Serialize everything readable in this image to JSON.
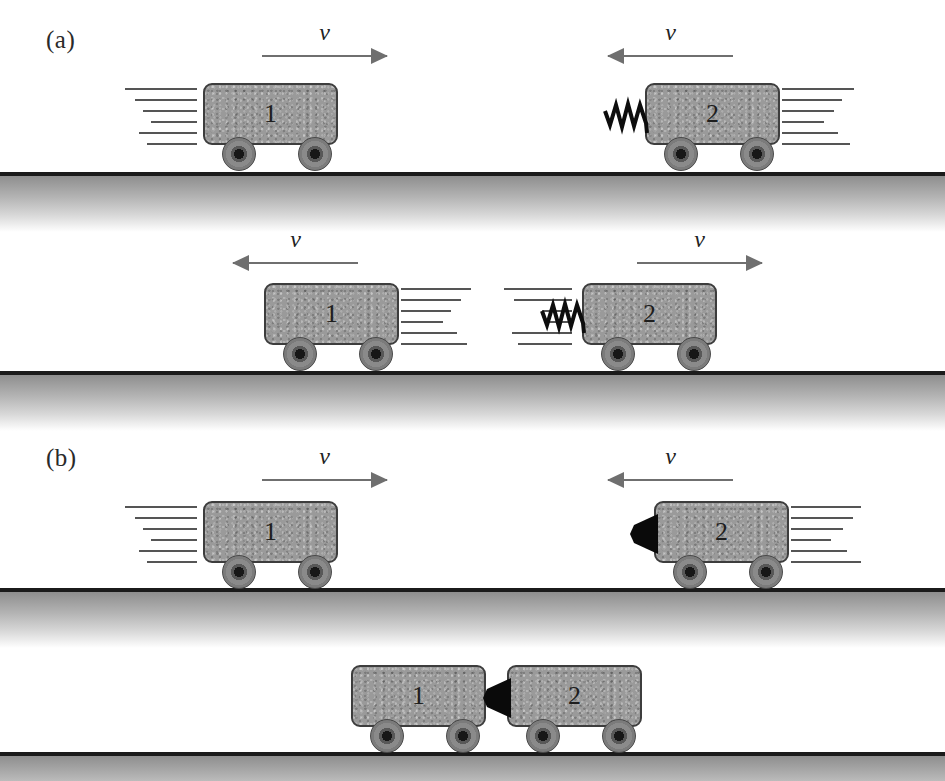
{
  "figure": {
    "panels": [
      {
        "label": "(a)",
        "x": 46,
        "y": 26
      },
      {
        "label": "(b)",
        "x": 46,
        "y": 444
      }
    ],
    "grounds": [
      {
        "y": 172
      },
      {
        "y": 371
      },
      {
        "y": 588
      },
      {
        "y": 752
      }
    ],
    "velocity_arrows": [
      {
        "name": "velocity-arrow-a1-cart1",
        "label": "v",
        "direction": "right",
        "x": 262,
        "y": 22,
        "width": 125
      },
      {
        "name": "velocity-arrow-a1-cart2",
        "label": "v",
        "direction": "left",
        "x": 608,
        "y": 22,
        "width": 125
      },
      {
        "name": "velocity-arrow-a2-cart1",
        "label": "v",
        "direction": "left",
        "x": 233,
        "y": 229,
        "width": 125
      },
      {
        "name": "velocity-arrow-a2-cart2",
        "label": "v",
        "direction": "right",
        "x": 637,
        "y": 229,
        "width": 125
      },
      {
        "name": "velocity-arrow-b1-cart1",
        "label": "v",
        "direction": "right",
        "x": 262,
        "y": 446,
        "width": 125
      },
      {
        "name": "velocity-arrow-b1-cart2",
        "label": "v",
        "direction": "left",
        "x": 608,
        "y": 446,
        "width": 125
      }
    ],
    "carts": [
      {
        "name": "cart-a1-one",
        "number": "1",
        "x": 203,
        "y": 83,
        "w": 135,
        "h": 62,
        "wheels": [
          22,
          98
        ],
        "motion": {
          "side": "left",
          "x": -78,
          "y": 5,
          "lines": [
            {
              "t": 0,
              "len": 72,
              "off": 0
            },
            {
              "t": 11,
              "len": 62,
              "off": 10
            },
            {
              "t": 22,
              "len": 54,
              "off": 18
            },
            {
              "t": 33,
              "len": 46,
              "off": 26
            },
            {
              "t": 44,
              "len": 58,
              "off": 14
            },
            {
              "t": 55,
              "len": 50,
              "off": 22
            }
          ]
        },
        "spring": null,
        "wedge": null
      },
      {
        "name": "cart-a1-two",
        "number": "2",
        "x": 645,
        "y": 83,
        "w": 135,
        "h": 62,
        "wheels": [
          22,
          98
        ],
        "motion": {
          "side": "right",
          "x": 137,
          "y": 5,
          "lines": [
            {
              "t": 0,
              "len": 72,
              "off": 0
            },
            {
              "t": 11,
              "len": 60,
              "off": 0
            },
            {
              "t": 22,
              "len": 52,
              "off": 0
            },
            {
              "t": 33,
              "len": 42,
              "off": 0
            },
            {
              "t": 44,
              "len": 56,
              "off": 0
            },
            {
              "t": 55,
              "len": 68,
              "off": 0
            }
          ]
        },
        "spring": {
          "side": "left",
          "x": -42,
          "y": 10
        },
        "wedge": null
      },
      {
        "name": "cart-a2-one",
        "number": "1",
        "x": 264,
        "y": 283,
        "w": 135,
        "h": 62,
        "wheels": [
          22,
          98
        ],
        "motion": {
          "side": "right",
          "x": 137,
          "y": 5,
          "lines": [
            {
              "t": 0,
              "len": 70,
              "off": 0
            },
            {
              "t": 11,
              "len": 60,
              "off": 0
            },
            {
              "t": 22,
              "len": 50,
              "off": 0
            },
            {
              "t": 33,
              "len": 42,
              "off": 0
            },
            {
              "t": 44,
              "len": 56,
              "off": 0
            },
            {
              "t": 55,
              "len": 66,
              "off": 0
            }
          ]
        },
        "spring": null,
        "wedge": null
      },
      {
        "name": "cart-a2-two",
        "number": "2",
        "x": 582,
        "y": 283,
        "w": 135,
        "h": 62,
        "wheels": [
          22,
          98
        ],
        "motion": {
          "side": "left",
          "x": -78,
          "y": 5,
          "lines": [
            {
              "t": 0,
              "len": 68,
              "off": 0
            },
            {
              "t": 11,
              "len": 58,
              "off": 10
            },
            {
              "t": 22,
              "len": 30,
              "off": 38
            },
            {
              "t": 33,
              "len": 28,
              "off": 40
            },
            {
              "t": 44,
              "len": 60,
              "off": 8
            },
            {
              "t": 55,
              "len": 54,
              "off": 14
            }
          ]
        },
        "spring": {
          "side": "left",
          "x": -42,
          "y": 10
        },
        "wedge": null
      },
      {
        "name": "cart-b1-one",
        "number": "1",
        "x": 203,
        "y": 501,
        "w": 135,
        "h": 62,
        "wheels": [
          22,
          98
        ],
        "motion": {
          "side": "left",
          "x": -78,
          "y": 5,
          "lines": [
            {
              "t": 0,
              "len": 72,
              "off": 0
            },
            {
              "t": 11,
              "len": 62,
              "off": 10
            },
            {
              "t": 22,
              "len": 54,
              "off": 18
            },
            {
              "t": 33,
              "len": 46,
              "off": 26
            },
            {
              "t": 44,
              "len": 58,
              "off": 14
            },
            {
              "t": 55,
              "len": 50,
              "off": 22
            }
          ]
        },
        "spring": null,
        "wedge": null
      },
      {
        "name": "cart-b1-two",
        "number": "2",
        "x": 654,
        "y": 501,
        "w": 135,
        "h": 62,
        "wheels": [
          22,
          98
        ],
        "motion": {
          "side": "right",
          "x": 137,
          "y": 5,
          "lines": [
            {
              "t": 0,
              "len": 70,
              "off": 0
            },
            {
              "t": 11,
              "len": 62,
              "off": 0
            },
            {
              "t": 22,
              "len": 52,
              "off": 0
            },
            {
              "t": 33,
              "len": 40,
              "off": 0
            },
            {
              "t": 44,
              "len": 56,
              "off": 0
            },
            {
              "t": 55,
              "len": 70,
              "off": 0
            }
          ]
        },
        "spring": null,
        "wedge": {
          "side": "left",
          "x": -26,
          "y": 13
        }
      },
      {
        "name": "cart-b2-one",
        "number": "1",
        "x": 351,
        "y": 665,
        "w": 135,
        "h": 62,
        "wheels": [
          22,
          98
        ],
        "motion": null,
        "spring": null,
        "wedge": null
      },
      {
        "name": "cart-b2-two",
        "number": "2",
        "x": 507,
        "y": 665,
        "w": 135,
        "h": 62,
        "wheels": [
          22,
          98
        ],
        "motion": null,
        "spring": null,
        "wedge": {
          "side": "left",
          "x": -26,
          "y": 13
        }
      }
    ],
    "colors": {
      "cart_fill": "#9a9a9a",
      "cart_stroke": "#3d3d3d",
      "ground_line": "#1b1b1b",
      "arrow": "#6f6f6f",
      "motion_line": "#555555",
      "spring": "#0d0d0d",
      "wedge": "#0a0a0a",
      "text": "#1e1e1e"
    }
  }
}
